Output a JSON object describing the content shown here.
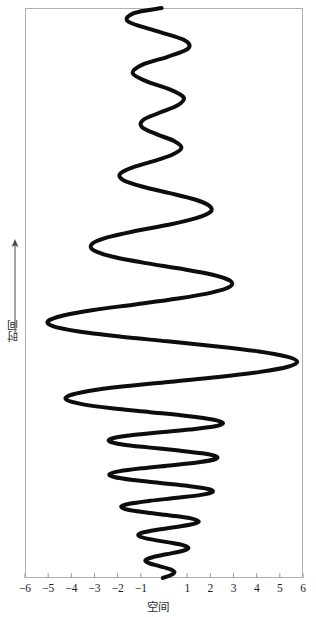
{
  "figure": {
    "background_color": "#ffffff",
    "frame_color": "#b0b0b0",
    "curve_color": "#0d0d0d",
    "tick_color": "#9a9a9a",
    "label_color": "#2b2b2b"
  },
  "axes": {
    "x_label": "空间",
    "y_label": "时间",
    "y_arrow": "up-arrow-icon",
    "x_ticks": [
      "−6",
      "−5",
      "−4",
      "−3",
      "−2",
      "−1",
      "1",
      "2",
      "3",
      "4",
      "5",
      "6"
    ]
  },
  "chart_data": {
    "type": "line",
    "title": "",
    "xlabel": "空间",
    "ylabel": "时间",
    "xlim": [
      -6,
      6
    ],
    "ylim": [
      0,
      100
    ],
    "grid": false,
    "legend": null,
    "xticks": [
      -6,
      -5,
      -4,
      -3,
      -2,
      -1,
      1,
      2,
      3,
      4,
      5,
      6
    ],
    "xticklabels": [
      "−6",
      "−5",
      "−4",
      "−3",
      "−2",
      "−1",
      "1",
      "2",
      "3",
      "4",
      "5",
      "6"
    ],
    "yticks": [],
    "yticklabels": [],
    "series": [
      {
        "name": "worldline",
        "description": "Modulated (beating) oscillation of space versus time; amplitude envelope grows to a maximum of 6 at mid-time then decays toward both ends.",
        "linewidth": 4,
        "color": "#0d0d0d",
        "x": [
          -0.1,
          -1.3,
          -1.55,
          -0.35,
          0.85,
          1.05,
          0.15,
          -0.95,
          -1.35,
          -0.75,
          0.25,
          0.85,
          0.6,
          -0.2,
          -0.9,
          -0.95,
          -0.3,
          0.45,
          0.75,
          0.35,
          -0.45,
          -1.35,
          -1.9,
          -1.75,
          -0.95,
          0.2,
          1.3,
          1.95,
          2.0,
          1.35,
          0.2,
          -1.25,
          -2.45,
          -3.1,
          -3.05,
          -2.25,
          -0.85,
          0.75,
          2.1,
          2.85,
          2.85,
          2.05,
          0.6,
          -1.25,
          -3.05,
          -4.35,
          -5.0,
          -4.8,
          -3.75,
          -2.0,
          0.15,
          2.3,
          4.1,
          5.3,
          5.75,
          5.35,
          4.15,
          2.35,
          0.3,
          -1.7,
          -3.25,
          -4.1,
          -4.2,
          -3.55,
          -2.25,
          -0.6,
          1.0,
          2.15,
          2.55,
          2.15,
          1.1,
          -0.25,
          -1.5,
          -2.25,
          -2.35,
          -1.8,
          -0.7,
          0.55,
          1.65,
          2.25,
          2.2,
          1.5,
          0.35,
          -0.9,
          -1.9,
          -2.35,
          -2.15,
          -1.35,
          -0.15,
          1.05,
          1.9,
          2.1,
          1.6,
          0.55,
          -0.6,
          -1.5,
          -1.85,
          -1.55,
          -0.7,
          0.35,
          1.2,
          1.5,
          1.15,
          0.35,
          -0.5,
          -1.05,
          -1.05,
          -0.55,
          0.2,
          0.85,
          1.05,
          0.75,
          0.1,
          -0.5,
          -0.8,
          -0.65,
          -0.2,
          0.25,
          0.45,
          0.3,
          -0.05
        ],
        "y": [
          100.0,
          98.8,
          96.8,
          94.6,
          92.5,
          90.5,
          88.5,
          86.6,
          84.6,
          82.7,
          80.8,
          78.9,
          77.1,
          75.3,
          73.6,
          71.9,
          70.2,
          68.6,
          67.0,
          65.4,
          63.9,
          62.4,
          60.9,
          59.4,
          57.9,
          56.4,
          54.9,
          53.4,
          51.9,
          50.4,
          48.9,
          47.4,
          45.9,
          44.4,
          42.9,
          41.4,
          39.9,
          38.5,
          37.1,
          35.7,
          34.3,
          32.9,
          31.5,
          30.1,
          28.8,
          27.5,
          26.2,
          25.0,
          23.8,
          22.6,
          21.4,
          20.2,
          19.0,
          17.8,
          16.6,
          15.4,
          14.2,
          13.0,
          11.9,
          10.8,
          9.7,
          8.6,
          7.6,
          6.6,
          5.6,
          4.7,
          3.8,
          2.9,
          2.1,
          1.3,
          0.6,
          -0.1,
          -0.8,
          -1.5,
          -2.2,
          -2.9,
          -3.6,
          -4.3,
          -5.0,
          -5.7,
          -6.4,
          -7.1,
          -7.8,
          -8.5,
          -9.2,
          -9.9,
          -10.6,
          -11.3,
          -12.0,
          -12.7,
          -13.4,
          -14.1,
          -14.8,
          -15.5,
          -16.2,
          -16.9,
          -17.6,
          -18.3,
          -19.0,
          -19.7,
          -20.4,
          -21.1,
          -21.8,
          -22.5,
          -23.2,
          -23.9,
          -24.6,
          -25.3,
          -26.0,
          -26.7,
          -27.4,
          -28.1,
          -28.8,
          -29.5,
          -30.2,
          -30.9,
          -31.6,
          -32.3,
          -33.0,
          -33.7,
          -34.4
        ]
      }
    ]
  },
  "geometry": {
    "frame_left_px": 25,
    "frame_right_px": 303,
    "frame_top_px": 8,
    "frame_bottom_px": 578
  }
}
